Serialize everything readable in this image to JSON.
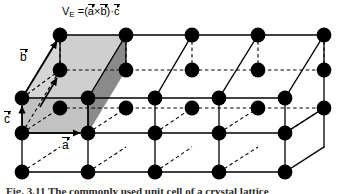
{
  "figure": {
    "type": "crystal-lattice-diagram",
    "background_color": "#ffffff",
    "node_color": "#000000",
    "line_color": "#000000",
    "formula": {
      "symbol": "V",
      "subscript": "E",
      "equals": "=",
      "open_paren": "(",
      "vec_a": "a",
      "cross": "×",
      "vec_b": "b",
      "close_paren": ")",
      "dot": "·",
      "vec_c": "c"
    },
    "axes": {
      "a_label": "a",
      "b_label": "b",
      "c_label": "c"
    },
    "caption": "Fig. 3.11  The commonly used unit cell of a crystal lattice",
    "unit_cell": {
      "top_face_color": "#cfcfcf",
      "front_face_color": "#c2c2c2",
      "right_face_color": "#8a8a8a",
      "left_face_color": "#d6d6d6"
    },
    "lattice": {
      "columns": 5,
      "rows_vertical": 3,
      "depth_layers": 2,
      "node_radius": 5.6,
      "spacing_x": 66,
      "spacing_y": 35,
      "depth_offset_x": 38,
      "depth_offset_y": -28
    }
  }
}
